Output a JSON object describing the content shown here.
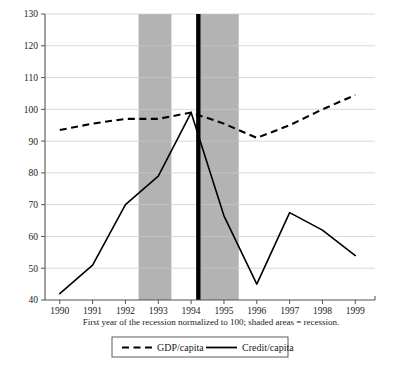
{
  "chart_data": {
    "type": "line",
    "title": "",
    "subtitle": "",
    "xlabel": "First year of the recession normalized to 100; shaded areas = recession.",
    "ylabel": "",
    "x": [
      1990,
      1991,
      1992,
      1993,
      1994,
      1995,
      1996,
      1997,
      1998,
      1999
    ],
    "xticklabels": [
      "1990",
      "1991",
      "1992",
      "1993",
      "1994",
      "1995",
      "1996",
      "1997",
      "1998",
      "1999"
    ],
    "yticklabels": [
      "40",
      "50",
      "60",
      "70",
      "80",
      "90",
      "100",
      "110",
      "120",
      "130"
    ],
    "yticks": [
      40,
      50,
      60,
      70,
      80,
      90,
      100,
      110,
      120,
      130
    ],
    "xlim": [
      1989.55,
      1999.6
    ],
    "ylim": [
      40,
      130
    ],
    "grid": true,
    "legend_position": "bottom-center",
    "series": [
      {
        "name": "GDP/capita",
        "style": "dashed",
        "color": "#000000",
        "values": [
          93.5,
          95.5,
          97.0,
          97.0,
          99.0,
          95.5,
          91.0,
          95.0,
          100.0,
          104.5
        ]
      },
      {
        "name": "Credit/capita",
        "style": "solid",
        "color": "#000000",
        "values": [
          42.0,
          51.0,
          70.0,
          79.0,
          99.0,
          66.5,
          45.0,
          67.5,
          62.0,
          54.0
        ]
      }
    ],
    "annotations": {
      "shaded_bands": [
        {
          "label": "recession-band-1",
          "x_start": 1992.4,
          "x_end": 1993.4,
          "color": "#b3b3b3"
        },
        {
          "label": "recession-band-2",
          "x_start": 1994.28,
          "x_end": 1995.45,
          "color": "#b3b3b3"
        }
      ],
      "marker_bar": {
        "label": "recession-start-marker",
        "x": 1994.22,
        "color": "#000000"
      }
    }
  },
  "caption": {
    "text": "First year of the recession normalized to 100; shaded areas = recession."
  },
  "legend": {
    "items": [
      {
        "label": "GDP/capita",
        "style": "dashed"
      },
      {
        "label": "Credit/capita",
        "style": "solid"
      }
    ]
  }
}
